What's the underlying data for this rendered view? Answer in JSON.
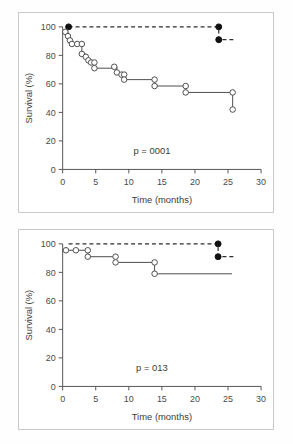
{
  "figure": {
    "panel_count": 2
  },
  "chart_data": [
    {
      "type": "line",
      "panel": "top",
      "title": "",
      "xlabel": "Time (months)",
      "ylabel": "Survival (%)",
      "xlim": [
        0,
        30
      ],
      "ylim": [
        0,
        100
      ],
      "xticks": [
        0,
        5,
        10,
        15,
        20,
        25,
        30
      ],
      "yticks": [
        0,
        20,
        40,
        60,
        80,
        100
      ],
      "grid": false,
      "legend_position": "none",
      "annotations": [
        {
          "text": "p = 0001",
          "x": 13.5,
          "y": 11
        }
      ],
      "series": [
        {
          "name": "upper-dashed-group",
          "style": "dashed",
          "marker": "filled-circle",
          "points": [
            {
              "x": 0.9,
              "y": 100
            },
            {
              "x": 23.6,
              "y": 100
            },
            {
              "x": 23.6,
              "y": 91
            },
            {
              "x": 26.2,
              "y": 91
            }
          ],
          "markers": [
            {
              "x": 0.9,
              "y": 100
            },
            {
              "x": 23.6,
              "y": 100
            },
            {
              "x": 23.6,
              "y": 91
            }
          ]
        },
        {
          "name": "lower-solid-group",
          "style": "solid",
          "marker": "open-circle",
          "points": [
            {
              "x": 0.4,
              "y": 96.5
            },
            {
              "x": 0.8,
              "y": 96.5
            },
            {
              "x": 0.8,
              "y": 93.5
            },
            {
              "x": 1.1,
              "y": 93.5
            },
            {
              "x": 1.1,
              "y": 90.5
            },
            {
              "x": 1.4,
              "y": 90.5
            },
            {
              "x": 1.4,
              "y": 88
            },
            {
              "x": 2.2,
              "y": 88
            },
            {
              "x": 2.9,
              "y": 88
            },
            {
              "x": 2.9,
              "y": 81
            },
            {
              "x": 3.5,
              "y": 81
            },
            {
              "x": 3.5,
              "y": 79
            },
            {
              "x": 3.9,
              "y": 79
            },
            {
              "x": 3.9,
              "y": 76.5
            },
            {
              "x": 4.3,
              "y": 76.5
            },
            {
              "x": 4.3,
              "y": 75
            },
            {
              "x": 4.8,
              "y": 75
            },
            {
              "x": 4.8,
              "y": 71
            },
            {
              "x": 7.8,
              "y": 71
            },
            {
              "x": 7.8,
              "y": 72
            },
            {
              "x": 8.2,
              "y": 72
            },
            {
              "x": 8.2,
              "y": 68
            },
            {
              "x": 8.9,
              "y": 68
            },
            {
              "x": 8.9,
              "y": 66.5
            },
            {
              "x": 9.3,
              "y": 66.5
            },
            {
              "x": 9.3,
              "y": 63
            },
            {
              "x": 13.9,
              "y": 63
            },
            {
              "x": 13.9,
              "y": 58.5
            },
            {
              "x": 18.6,
              "y": 58.5
            },
            {
              "x": 18.6,
              "y": 54
            },
            {
              "x": 25.7,
              "y": 54
            },
            {
              "x": 25.7,
              "y": 42
            }
          ],
          "markers": [
            {
              "x": 0.4,
              "y": 96.5
            },
            {
              "x": 0.8,
              "y": 93.5
            },
            {
              "x": 1.1,
              "y": 90.5
            },
            {
              "x": 1.4,
              "y": 88
            },
            {
              "x": 2.2,
              "y": 88
            },
            {
              "x": 2.9,
              "y": 88
            },
            {
              "x": 2.9,
              "y": 81
            },
            {
              "x": 3.5,
              "y": 79
            },
            {
              "x": 3.9,
              "y": 76.5
            },
            {
              "x": 4.3,
              "y": 75
            },
            {
              "x": 4.8,
              "y": 75
            },
            {
              "x": 4.8,
              "y": 71
            },
            {
              "x": 7.8,
              "y": 72
            },
            {
              "x": 8.2,
              "y": 68
            },
            {
              "x": 8.9,
              "y": 66.5
            },
            {
              "x": 9.3,
              "y": 66.5
            },
            {
              "x": 9.3,
              "y": 63
            },
            {
              "x": 13.9,
              "y": 63
            },
            {
              "x": 13.9,
              "y": 58.5
            },
            {
              "x": 18.6,
              "y": 58.5
            },
            {
              "x": 18.6,
              "y": 54
            },
            {
              "x": 25.7,
              "y": 54
            },
            {
              "x": 25.7,
              "y": 42
            }
          ]
        }
      ]
    },
    {
      "type": "line",
      "panel": "bottom",
      "title": "",
      "xlabel": "Time (months)",
      "ylabel": "Survival (%)",
      "xlim": [
        0,
        30
      ],
      "ylim": [
        0,
        100
      ],
      "xticks": [
        0,
        5,
        10,
        15,
        20,
        25,
        30
      ],
      "yticks": [
        0,
        20,
        40,
        60,
        80,
        100
      ],
      "grid": false,
      "legend_position": "none",
      "annotations": [
        {
          "text": "p = 013",
          "x": 13.5,
          "y": 11
        }
      ],
      "series": [
        {
          "name": "upper-dashed-group",
          "style": "dashed",
          "marker": "filled-circle",
          "points": [
            {
              "x": 0.9,
              "y": 100
            },
            {
              "x": 23.5,
              "y": 100
            },
            {
              "x": 23.5,
              "y": 91
            },
            {
              "x": 26.2,
              "y": 91
            }
          ],
          "markers": [
            {
              "x": 23.5,
              "y": 100
            },
            {
              "x": 23.5,
              "y": 91
            }
          ]
        },
        {
          "name": "lower-solid-group",
          "style": "solid",
          "marker": "open-circle",
          "points": [
            {
              "x": 0.5,
              "y": 95.5
            },
            {
              "x": 2.0,
              "y": 95.5
            },
            {
              "x": 3.8,
              "y": 95.5
            },
            {
              "x": 3.8,
              "y": 91
            },
            {
              "x": 8.0,
              "y": 91
            },
            {
              "x": 8.0,
              "y": 87
            },
            {
              "x": 13.9,
              "y": 87
            },
            {
              "x": 13.9,
              "y": 79
            },
            {
              "x": 25.6,
              "y": 79
            }
          ],
          "markers": [
            {
              "x": 0.5,
              "y": 95.5
            },
            {
              "x": 2.0,
              "y": 95.5
            },
            {
              "x": 3.8,
              "y": 95.5
            },
            {
              "x": 3.8,
              "y": 91
            },
            {
              "x": 8.0,
              "y": 91
            },
            {
              "x": 8.0,
              "y": 87
            },
            {
              "x": 13.9,
              "y": 87
            },
            {
              "x": 13.9,
              "y": 79
            }
          ]
        }
      ]
    }
  ]
}
